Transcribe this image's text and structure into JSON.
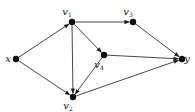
{
  "diagram": {
    "type": "directed-graph",
    "nodes": [
      {
        "id": "x",
        "label": "x",
        "sub": "",
        "cx": 16,
        "cy": 59,
        "lx": 8,
        "ly": 62
      },
      {
        "id": "v1",
        "label": "v",
        "sub": "1",
        "cx": 72,
        "cy": 22,
        "lx": 67,
        "ly": 15
      },
      {
        "id": "v3",
        "label": "v",
        "sub": "3",
        "cx": 133,
        "cy": 22,
        "lx": 128,
        "ly": 15
      },
      {
        "id": "v4",
        "label": "v",
        "sub": "4",
        "cx": 104,
        "cy": 55,
        "lx": 99,
        "ly": 68
      },
      {
        "id": "v2",
        "label": "v",
        "sub": "2",
        "cx": 73,
        "cy": 97,
        "lx": 68,
        "ly": 109
      },
      {
        "id": "y",
        "label": "y",
        "sub": "",
        "cx": 182,
        "cy": 59,
        "lx": 187,
        "ly": 62
      }
    ],
    "edges": [
      {
        "from": "x",
        "to": "v1"
      },
      {
        "from": "x",
        "to": "v2"
      },
      {
        "from": "v1",
        "to": "v3"
      },
      {
        "from": "v1",
        "to": "v4"
      },
      {
        "from": "v1",
        "to": "v2"
      },
      {
        "from": "v4",
        "to": "v2"
      },
      {
        "from": "v4",
        "to": "y"
      },
      {
        "from": "v3",
        "to": "y"
      },
      {
        "from": "v2",
        "to": "y"
      }
    ]
  }
}
